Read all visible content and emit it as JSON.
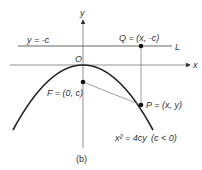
{
  "figure": {
    "caption": "(b)",
    "axes": {
      "x_label": "x",
      "y_label": "y",
      "origin_label": "O"
    },
    "directrix": {
      "label": "y = -c",
      "line_name": "L"
    },
    "points": {
      "Q": "Q = (x, -c)",
      "F": "F = (0, c)",
      "P": "P = (x, y)"
    },
    "equation": "x² = 4cy",
    "condition": "(c < 0)"
  },
  "colors": {
    "ink": "#333333",
    "thin": "#777777",
    "curve": "#222222"
  }
}
